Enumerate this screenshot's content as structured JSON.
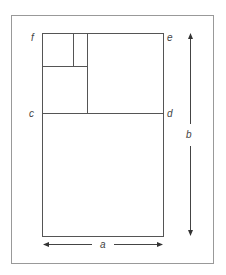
{
  "diagram": {
    "stroke_color": "#555555",
    "frame_color": "#888888",
    "labels": {
      "f": "f",
      "e": "e",
      "c": "c",
      "d": "d",
      "a": "a",
      "b": "b"
    },
    "dimensions": [
      {
        "label": "a",
        "orientation": "horizontal",
        "meaning": "width"
      },
      {
        "label": "b",
        "orientation": "vertical",
        "meaning": "height"
      }
    ]
  }
}
